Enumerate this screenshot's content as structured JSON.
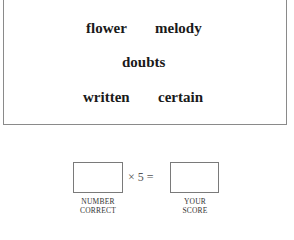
{
  "word_box": {
    "row1": [
      "flower",
      "melody"
    ],
    "row2": [
      "doubts"
    ],
    "row3": [
      "written",
      "certain"
    ]
  },
  "score": {
    "operator_times": "×",
    "multiplier": "5",
    "operator_equals": "=",
    "number_correct_label_line1": "NUMBER",
    "number_correct_label_line2": "CORRECT",
    "your_score_label_line1": "YOUR",
    "your_score_label_line2": "SCORE"
  }
}
